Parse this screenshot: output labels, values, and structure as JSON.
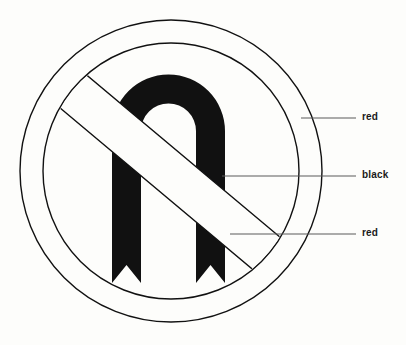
{
  "figure": {
    "background_color": "#fdfdfb",
    "ink_color": "#111111",
    "leader_line_color": "#5a5a5a"
  },
  "sign": {
    "name": "no-u-turn-sign",
    "center": {
      "x": 171,
      "y": 171
    },
    "outer_circle_radius": 151,
    "inner_circle_radius": 128,
    "ring_label": "red",
    "symbol_label": "black",
    "slash_label": "red",
    "u_turn_arrow": {
      "outer_left_x": 112,
      "outer_right_x": 225,
      "arch_top_y": 75,
      "legs_bottom_y": 283,
      "left_leg_right_x": 148,
      "right_leg_left_x": 196
    },
    "slash_band": {
      "start": {
        "x": 62,
        "y": 82
      },
      "end": {
        "x": 272,
        "y": 258
      }
    }
  },
  "callouts": [
    {
      "id": "red-top",
      "label": "red",
      "target": "outer-ring",
      "line_start": {
        "x": 301,
        "y": 118
      },
      "line_end": {
        "x": 356,
        "y": 118
      },
      "text_x": 362,
      "text_y": 118
    },
    {
      "id": "black",
      "label": "black",
      "target": "u-turn-arrow",
      "line_start": {
        "x": 222,
        "y": 176
      },
      "line_end": {
        "x": 356,
        "y": 176
      },
      "text_x": 362,
      "text_y": 176
    },
    {
      "id": "red-bottom",
      "label": "red",
      "target": "diagonal-slash",
      "line_start": {
        "x": 230,
        "y": 234
      },
      "line_end": {
        "x": 356,
        "y": 234
      },
      "text_x": 362,
      "text_y": 234
    }
  ]
}
